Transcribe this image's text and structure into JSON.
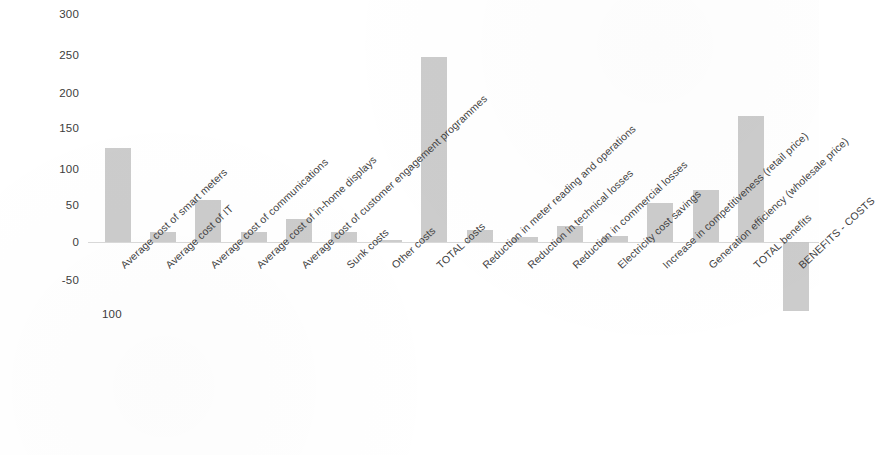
{
  "chart_data": {
    "type": "bar",
    "title": "",
    "subtitle": "",
    "xlabel": "",
    "ylabel": "",
    "ylim": [
      -100,
      300
    ],
    "yticks": [
      300,
      250,
      200,
      150,
      100,
      50,
      0,
      -50,
      -100
    ],
    "ytick_labels": [
      "300",
      "250",
      "200",
      "150",
      "100",
      "50",
      "0",
      "-50",
      "100"
    ],
    "grid": false,
    "legend": "none",
    "bar_color": "#c8c8c8",
    "categories": [
      "Average cost of smart meters",
      "Average cost of IT",
      "Average cost of communications",
      "Average cost of in-home displays",
      "Average cost of customer engagement programmes",
      "Sunk costs",
      "Other costs",
      "TOTAL costs",
      "Reduction in meter reading and operations",
      "Reduction in technical losses",
      "Reduction in commercial losses",
      "Electricity cost savings",
      "Increase in competitiveness (retail price)",
      "Generation efficiency (wholesale price)",
      "TOTAL benefits",
      "BENEFITS - COSTS"
    ],
    "values": [
      125,
      13,
      55,
      13,
      30,
      13,
      3,
      245,
      16,
      6,
      21,
      8,
      51,
      69,
      167,
      -92
    ]
  }
}
